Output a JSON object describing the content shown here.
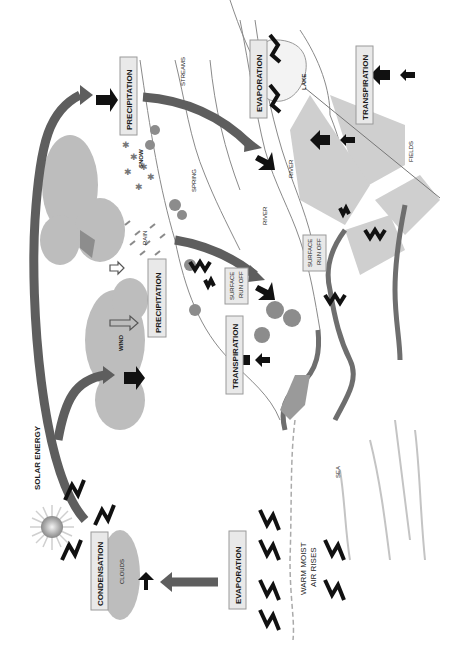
{
  "diagram": {
    "orientation": "rotated 90° counter-clockwise (labels read bottom-to-top)",
    "labels": {
      "solar_energy": "SOLAR ENERGY",
      "condensation": "CONDENSATION",
      "clouds": "CLOUDS",
      "evaporation_sea": "EVAPORATION",
      "warm_moist_air_line1": "WARM MOIST",
      "warm_moist_air_line2": "AIR RISES",
      "sea": "SEA",
      "wind": "WIND",
      "precipitation_rain": "PRECIPITATION",
      "rain": "RAIN",
      "precipitation_snow": "PRECIPITATION",
      "snow": "SNOW",
      "spring": "SPRING",
      "streams": "STREAMS",
      "transpiration_trees": "TRANSPIRATION",
      "surface_run_off_1_line1": "SURFACE",
      "surface_run_off_1_line2": "RUN OFF",
      "surface_run_off_2_line1": "SURFACE",
      "surface_run_off_2_line2": "RUN OFF",
      "river_1": "RIVER",
      "river_2": "RIVER",
      "evaporation_lake": "EVAPORATION",
      "lake": "LAKE",
      "transpiration_fields": "TRANSPIRATION",
      "fields": "FIELDS"
    },
    "icons": [
      "sun-icon",
      "heat-wave-arrow-icon",
      "flow-arrow-icon",
      "cloud-icon",
      "tree-icon",
      "snowflake-icon",
      "raindrop-icon",
      "wind-arrow-icon"
    ],
    "colors": {
      "arc": "#5e5e5e",
      "cloud": "#bdbdbd",
      "label_box": "#e9e9e9",
      "field": "#cfcfcf",
      "arrow": "#111111"
    }
  }
}
